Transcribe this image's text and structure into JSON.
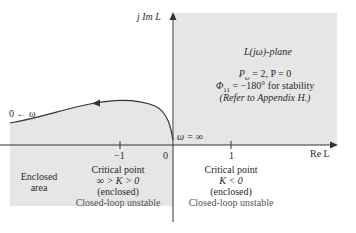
{
  "diagram": {
    "type": "nyquist-plot",
    "plane_label": "L(jω)-plane",
    "axes": {
      "vertical_label": "j Im L",
      "horizontal_label": "Re L",
      "ticks": [
        {
          "value": -1,
          "label": "−1"
        },
        {
          "value": 0,
          "label": "0"
        },
        {
          "value": 1,
          "label": "1"
        }
      ]
    },
    "curve": {
      "start_label": "0 ← ω",
      "end_label": "ω = ∞",
      "direction": "right-to-left"
    },
    "info": {
      "line1": "P_ω = 2, P = 0",
      "line1_parts": {
        "P": "P",
        "sub": "ω",
        "rest": " = 2, P = 0"
      },
      "line2_phi": "Φ",
      "line2_sub": "11",
      "line2_rest": " = −180° for stability",
      "line3": "(Refer to Appendix H.)"
    },
    "regions": {
      "enclosed_area": {
        "line1": "Enclosed",
        "line2": "area"
      },
      "left_critical": {
        "title": "Critical point",
        "condition": "∞ > K > 0",
        "status": "(enclosed)",
        "result": "Closed-loop unstable"
      },
      "right_critical": {
        "title": "Critical point",
        "condition": "K < 0",
        "status": "(enclosed)",
        "result": "Closed-loop unstable"
      }
    },
    "colors": {
      "shade": "#e6e6e6",
      "axis": "#333333",
      "curve": "#333333"
    }
  }
}
